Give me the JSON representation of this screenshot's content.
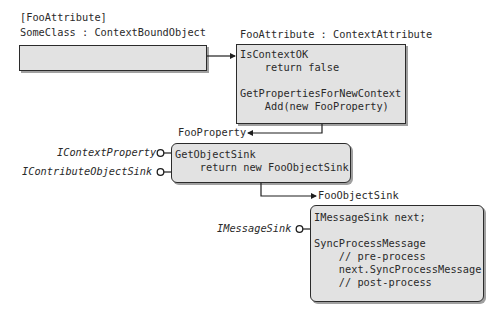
{
  "context_bound_object": {
    "attribute_label": "[FooAttribute]",
    "class_label": "SomeClass : ContextBoundObject"
  },
  "context_attribute": {
    "title": "FooAttribute : ContextAttribute",
    "code": "IsContextOK\n    return false\n\nGetPropertiesForNewContext\n    Add(new FooProperty)"
  },
  "context_property": {
    "output_label": "FooProperty",
    "interfaces": [
      "IContextProperty",
      "IContributeObjectSink"
    ],
    "code": "GetObjectSink\n    return new FooObjectSink"
  },
  "object_sink": {
    "output_label": "FooObjectSink",
    "interfaces": [
      "IMessageSink"
    ],
    "code": "IMessageSink next;\n\nSyncProcessMessage\n    // pre-process\n    next.SyncProcessMessage\n    // post-process"
  },
  "colors": {
    "box_fill": "#e2e2e2",
    "box_border": "#2b2b2b",
    "shadow": "#a0a0a0",
    "text": "#2a2a2a"
  }
}
